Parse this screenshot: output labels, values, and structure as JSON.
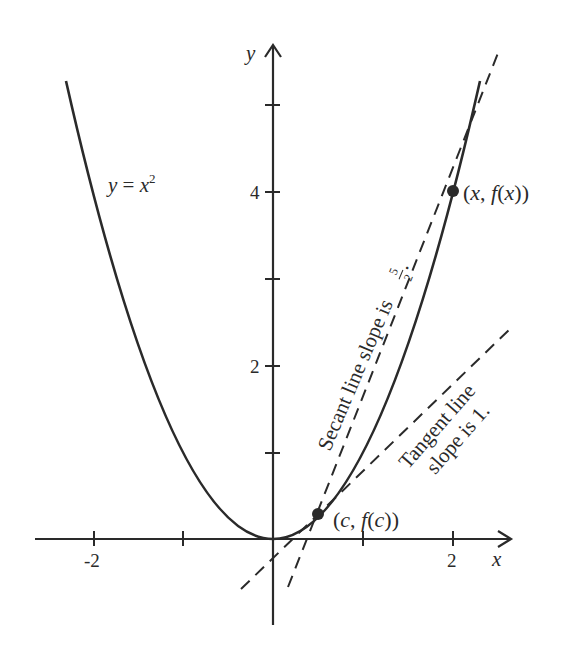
{
  "diagram": {
    "type": "function-graph",
    "function_label": "y = x²",
    "function_label_parts": {
      "lhs": "y",
      "eq": " = ",
      "base": "x",
      "exp": "2"
    },
    "axes": {
      "x_label": "x",
      "y_label": "y",
      "x_ticks": [
        -2,
        -1,
        1,
        2
      ],
      "x_tick_labels": [
        "-2",
        "2"
      ],
      "y_ticks": [
        1,
        2,
        3,
        4,
        5
      ],
      "y_tick_labels": [
        "2",
        "4"
      ]
    },
    "points": [
      {
        "label": "(c, f(c))",
        "x": 0.5,
        "y": 0.25
      },
      {
        "label": "(x, f(x))",
        "x": 2,
        "y": 4
      }
    ],
    "lines": [
      {
        "name": "secant",
        "style": "dashed",
        "slope": 2.5,
        "label": "Secant line slope is",
        "slope_num": "5",
        "slope_den": "2",
        "suffix": "."
      },
      {
        "name": "tangent",
        "style": "dashed",
        "slope": 1,
        "label_line1": "Tangent line",
        "label_line2": "slope is 1."
      }
    ],
    "colors": {
      "ink": "#2a2a2a",
      "background": "#ffffff"
    }
  }
}
